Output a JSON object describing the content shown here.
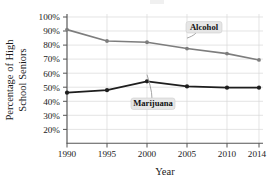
{
  "chart_data": {
    "type": "line",
    "title": "",
    "xlabel": "Year",
    "ylabel": "Percentage of High School Seniors",
    "ylabel_line1": "Percentage of High",
    "ylabel_line2": "School Seniors",
    "x": [
      1990,
      1995,
      2000,
      2005,
      2010,
      2014
    ],
    "xtick_labels": [
      "1990",
      "1995",
      "2000",
      "2005",
      "2010",
      "2014"
    ],
    "ytick_labels": [
      "10%",
      "20%",
      "30%",
      "40%",
      "50%",
      "60%",
      "70%",
      "80%",
      "90%",
      "100%"
    ],
    "ytick_values": [
      10,
      20,
      30,
      40,
      50,
      60,
      70,
      80,
      90,
      100
    ],
    "ylim": [
      0,
      100
    ],
    "xlim": [
      1990,
      2014
    ],
    "grid": true,
    "legend_position": "inline-annotations",
    "series": [
      {
        "name": "Alcohol",
        "color": "#7d7d7d",
        "marker": "circle",
        "values": [
          90,
          81,
          80,
          75,
          71,
          66
        ]
      },
      {
        "name": "Marijuana",
        "color": "#1e1e1e",
        "marker": "circle",
        "values": [
          40,
          42,
          49,
          45,
          44,
          44
        ]
      }
    ],
    "annotations": [
      {
        "label": "Alcohol",
        "points_to_year": 2005,
        "points_to_value": 75
      },
      {
        "label": "Marijuana",
        "points_to_year": 2000,
        "points_to_value": 49
      }
    ]
  }
}
